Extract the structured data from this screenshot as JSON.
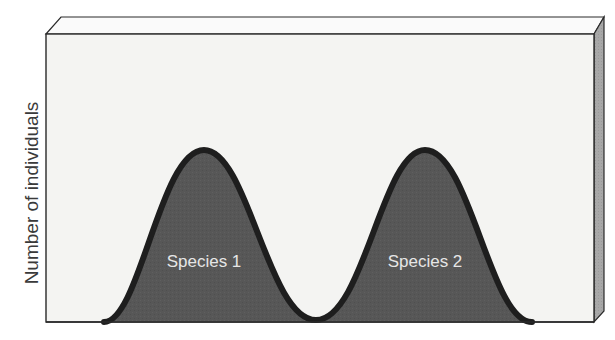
{
  "figure": {
    "y_axis_label": "Number of individuals",
    "curves": [
      {
        "label": "Species 1"
      },
      {
        "label": "Species 2"
      }
    ]
  },
  "colors": {
    "panel_face": "#f4f4f2",
    "panel_top": "#fafafa",
    "panel_side": "#a8a8a8",
    "panel_edge": "#2a2a2a",
    "curve_fill": "#575757",
    "curve_outline": "#1e1e1e",
    "label_text": "#e6e6e6"
  }
}
